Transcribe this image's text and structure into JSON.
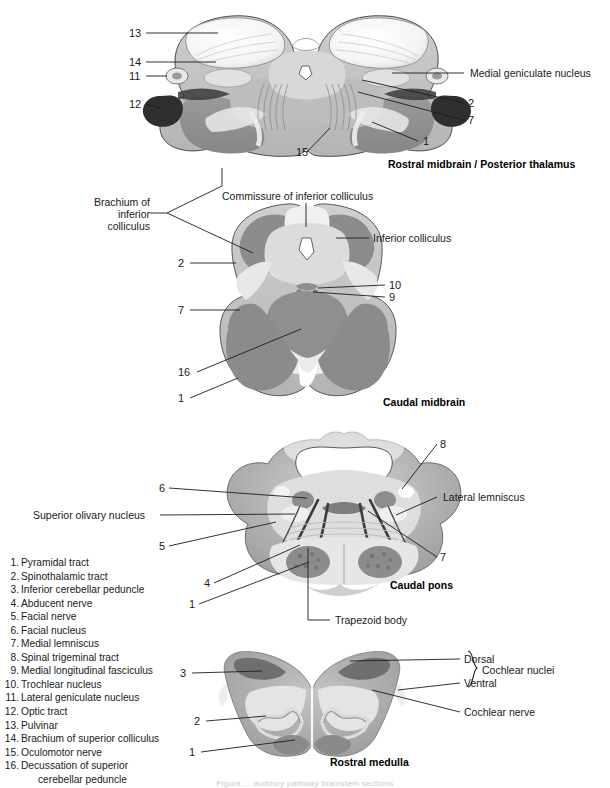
{
  "page": {
    "caption_footer": "Figure ... auditory pathway brainstem sections"
  },
  "sections": [
    {
      "id": "rostral-midbrain",
      "title": "Rostral midbrain /  Posterior thalamus"
    },
    {
      "id": "caudal-midbrain",
      "title": "Caudal midbrain"
    },
    {
      "id": "caudal-pons",
      "title": "Caudal pons"
    },
    {
      "id": "rostral-medulla",
      "title": "Rostral medulla"
    }
  ],
  "rostral_midbrain": {
    "numbers": {
      "n13": "13",
      "n14": "14",
      "n11": "11",
      "n12": "12",
      "n15": "15",
      "n2": "2",
      "n7": "7",
      "n1": "1"
    },
    "labels": {
      "medial_geniculate_nucleus": "Medial geniculate nucleus"
    }
  },
  "caudal_midbrain": {
    "numbers": {
      "n2": "2",
      "n7": "7",
      "n16": "16",
      "n1": "1",
      "n10": "10",
      "n9": "9"
    },
    "labels": {
      "brachium_line1": "Brachium of",
      "brachium_line2": "inferior",
      "brachium_line3": "colliculus",
      "commissure_of_inferior_colliculus": "Commissure of inferior colliculus",
      "inferior_colliculus": "Inferior colliculus"
    }
  },
  "caudal_pons": {
    "numbers": {
      "n6": "6",
      "n5": "5",
      "n4": "4",
      "n1": "1",
      "n8": "8",
      "n7": "7"
    },
    "labels": {
      "superior_olivary_nucleus": "Superior olivary nucleus",
      "lateral_lemniscus": "Lateral lemniscus",
      "trapezoid_body": "Trapezoid body"
    }
  },
  "rostral_medulla": {
    "numbers": {
      "n3": "3",
      "n2": "2",
      "n1": "1"
    },
    "labels": {
      "dorsal": "Dorsal",
      "ventral": "Ventral",
      "cochlear_nuclei": "Cochlear nuclei",
      "cochlear_nerve": "Cochlear nerve"
    }
  },
  "legend": {
    "items": [
      {
        "n": "1.",
        "text": "Pyramidal tract"
      },
      {
        "n": "2.",
        "text": "Spinothalamic tract"
      },
      {
        "n": "3.",
        "text": "Inferior cerebellar peduncle"
      },
      {
        "n": "4.",
        "text": "Abducent nerve"
      },
      {
        "n": "5.",
        "text": "Facial nerve"
      },
      {
        "n": "6.",
        "text": "Facial nucleus"
      },
      {
        "n": "7.",
        "text": "Medial lemniscus"
      },
      {
        "n": "8.",
        "text": "Spinal trigeminal tract"
      },
      {
        "n": "9.",
        "text": "Medial longitudinal fasciculus"
      },
      {
        "n": "10.",
        "text": "Trochlear nucleus"
      },
      {
        "n": "11.",
        "text": "Lateral geniculate nucleus"
      },
      {
        "n": "12.",
        "text": "Optic tract"
      },
      {
        "n": "13.",
        "text": "Pulvinar"
      },
      {
        "n": "14.",
        "text": "Brachium of superior colliculus"
      },
      {
        "n": "15.",
        "text": "Oculomotor nerve"
      },
      {
        "n": "16.",
        "text": "Decussation of superior",
        "cont": "cerebellar peduncle"
      }
    ]
  },
  "colors": {
    "ink": "#1a1a1a",
    "gray_dark": "#8e8e8e",
    "gray_mid": "#a8a8a8",
    "gray_light": "#c9c9c9",
    "gray_pale": "#e2e2e2",
    "white": "#ffffff"
  }
}
